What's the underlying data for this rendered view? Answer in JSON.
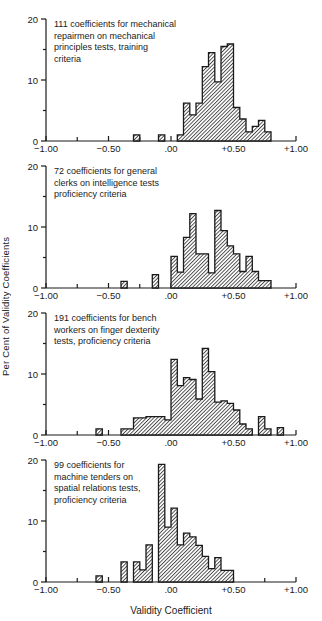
{
  "figure": {
    "ylabel": "Per Cent of Validity Coefficients",
    "xlabel": "Validity Coefficient"
  },
  "colors": {
    "ink": "#1a1a1a",
    "background": "#ffffff",
    "hatch": "#1a1a1a"
  },
  "axis": {
    "xlim": [
      -1.0,
      1.0
    ],
    "ylim": [
      0,
      20
    ],
    "x_major_ticks": [
      -1.0,
      -0.5,
      0.0,
      0.5,
      1.0
    ],
    "x_major_labels": [
      "−1.00",
      "−0.50",
      ".00",
      "+0.50",
      "+1.00"
    ],
    "x_minor_ticks": [
      -0.75,
      -0.25,
      0.25,
      0.75
    ],
    "y_major_ticks": [
      0,
      10,
      20
    ],
    "y_major_labels": [
      "0",
      "10",
      "20"
    ],
    "y_minor_ticks": [
      5,
      15
    ]
  },
  "chart_data": [
    {
      "type": "bar",
      "subtype": "histogram",
      "n_coefficients": 111,
      "title": "111 coefficients for mechanical\nrepairmen on mechanical\nprinciples tests, training\ncriteria",
      "bin_width": 0.05,
      "xlabel": "Validity Coefficient",
      "ylabel": "Per Cent of Validity Coefficients",
      "bins": [
        {
          "x": -0.3,
          "pct": 1.0
        },
        {
          "x": -0.1,
          "pct": 1.0
        },
        {
          "x": 0.05,
          "pct": 1.0
        },
        {
          "x": 0.1,
          "pct": 6.2
        },
        {
          "x": 0.15,
          "pct": 4.3
        },
        {
          "x": 0.2,
          "pct": 6.2
        },
        {
          "x": 0.25,
          "pct": 12.2
        },
        {
          "x": 0.3,
          "pct": 14.5
        },
        {
          "x": 0.35,
          "pct": 9.7
        },
        {
          "x": 0.4,
          "pct": 15.5
        },
        {
          "x": 0.45,
          "pct": 15.9
        },
        {
          "x": 0.5,
          "pct": 5.5
        },
        {
          "x": 0.55,
          "pct": 3.6
        },
        {
          "x": 0.6,
          "pct": 1.5
        },
        {
          "x": 0.65,
          "pct": 2.4
        },
        {
          "x": 0.7,
          "pct": 3.4
        },
        {
          "x": 0.75,
          "pct": 1.5
        }
      ]
    },
    {
      "type": "bar",
      "subtype": "histogram",
      "n_coefficients": 72,
      "title": "72 coefficients for general\nclerks on intelligence tests\nproficiency criteria",
      "bin_width": 0.05,
      "bins": [
        {
          "x": -0.4,
          "pct": 1.1
        },
        {
          "x": -0.15,
          "pct": 2.2
        },
        {
          "x": 0.0,
          "pct": 5.2
        },
        {
          "x": 0.05,
          "pct": 2.6
        },
        {
          "x": 0.1,
          "pct": 8.3
        },
        {
          "x": 0.15,
          "pct": 12.2
        },
        {
          "x": 0.2,
          "pct": 5.6
        },
        {
          "x": 0.25,
          "pct": 5.6
        },
        {
          "x": 0.3,
          "pct": 2.5
        },
        {
          "x": 0.35,
          "pct": 12.7
        },
        {
          "x": 0.4,
          "pct": 9.4
        },
        {
          "x": 0.45,
          "pct": 6.9
        },
        {
          "x": 0.5,
          "pct": 5.6
        },
        {
          "x": 0.55,
          "pct": 2.7
        },
        {
          "x": 0.6,
          "pct": 5.2
        },
        {
          "x": 0.65,
          "pct": 2.7
        },
        {
          "x": 0.7,
          "pct": 1.2
        },
        {
          "x": 0.75,
          "pct": 1.2
        }
      ]
    },
    {
      "type": "bar",
      "subtype": "histogram",
      "n_coefficients": 191,
      "title": "191 coefficients for bench\nworkers on finger dexterity\ntests, proficiency criteria",
      "bin_width": 0.05,
      "bins": [
        {
          "x": -0.6,
          "pct": 1.0
        },
        {
          "x": -0.4,
          "pct": 1.0
        },
        {
          "x": -0.35,
          "pct": 1.0
        },
        {
          "x": -0.3,
          "pct": 2.8
        },
        {
          "x": -0.25,
          "pct": 2.8
        },
        {
          "x": -0.2,
          "pct": 3.0
        },
        {
          "x": -0.15,
          "pct": 3.0
        },
        {
          "x": -0.1,
          "pct": 3.0
        },
        {
          "x": -0.05,
          "pct": 2.5
        },
        {
          "x": 0.0,
          "pct": 12.4
        },
        {
          "x": 0.05,
          "pct": 8.1
        },
        {
          "x": 0.1,
          "pct": 9.4
        },
        {
          "x": 0.15,
          "pct": 9.1
        },
        {
          "x": 0.2,
          "pct": 5.9
        },
        {
          "x": 0.25,
          "pct": 14.2
        },
        {
          "x": 0.3,
          "pct": 10.4
        },
        {
          "x": 0.35,
          "pct": 5.4
        },
        {
          "x": 0.4,
          "pct": 5.6
        },
        {
          "x": 0.45,
          "pct": 5.2
        },
        {
          "x": 0.5,
          "pct": 4.1
        },
        {
          "x": 0.55,
          "pct": 1.8
        },
        {
          "x": 0.6,
          "pct": 1.0
        },
        {
          "x": 0.7,
          "pct": 3.0
        },
        {
          "x": 0.75,
          "pct": 1.0
        },
        {
          "x": 0.85,
          "pct": 1.2
        }
      ]
    },
    {
      "type": "bar",
      "subtype": "histogram",
      "n_coefficients": 99,
      "title": "99 coefficients for\nmachine tenders on\nspatial relations tests,\nproficiency criteria",
      "bin_width": 0.05,
      "bins": [
        {
          "x": -0.6,
          "pct": 1.0
        },
        {
          "x": -0.4,
          "pct": 3.3
        },
        {
          "x": -0.3,
          "pct": 3.3
        },
        {
          "x": -0.25,
          "pct": 2.0
        },
        {
          "x": -0.2,
          "pct": 6.1
        },
        {
          "x": -0.1,
          "pct": 19.3
        },
        {
          "x": -0.05,
          "pct": 9.0
        },
        {
          "x": 0.0,
          "pct": 12.1
        },
        {
          "x": 0.05,
          "pct": 6.1
        },
        {
          "x": 0.1,
          "pct": 8.0
        },
        {
          "x": 0.15,
          "pct": 7.4
        },
        {
          "x": 0.2,
          "pct": 6.0
        },
        {
          "x": 0.25,
          "pct": 4.2
        },
        {
          "x": 0.3,
          "pct": 2.2
        },
        {
          "x": 0.35,
          "pct": 4.0
        },
        {
          "x": 0.4,
          "pct": 1.9
        },
        {
          "x": 0.45,
          "pct": 1.9
        }
      ]
    }
  ]
}
